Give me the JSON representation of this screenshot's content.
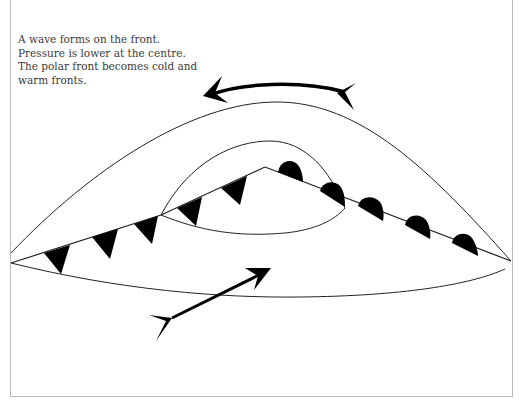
{
  "diagram": {
    "caption_lines": [
      "A wave forms on the front.",
      "Pressure is lower at the centre.",
      "The polar front becomes cold and",
      "warm fronts."
    ],
    "elements": {
      "upper_arrow": "anticlockwise wind arrow above the low",
      "lower_arrow": "wind arrow crossing lower boundary toward the low",
      "cold_front": "line with triangles (cold front)",
      "warm_front": "line with semicircles (warm front)",
      "outer_isobar": "outer curved boundary",
      "inner_isobar": "inner curved boundary around wave",
      "warm_sector": "region between cold and warm fronts"
    },
    "colors": {
      "line": "#222222",
      "symbol_fill": "#000000",
      "frame": "#b8b8b8",
      "text": "#3a3a3a"
    }
  }
}
